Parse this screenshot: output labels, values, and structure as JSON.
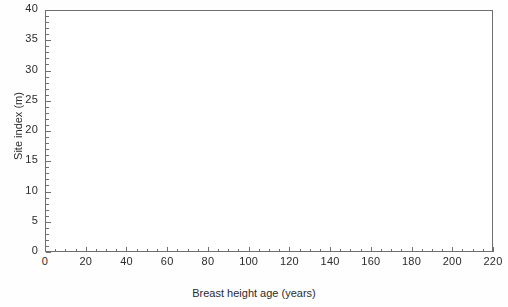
{
  "chart_data": {
    "type": "line",
    "title": "",
    "subtitle": "",
    "xlabel": "Breast height age (years)",
    "ylabel": "Site index (m)",
    "xlim": [
      0,
      220
    ],
    "ylim": [
      0,
      40
    ],
    "xticks": [
      0,
      20,
      40,
      60,
      80,
      100,
      120,
      140,
      160,
      180,
      200,
      220
    ],
    "yticks": [
      0,
      5,
      10,
      15,
      20,
      25,
      30,
      35,
      40
    ],
    "x_minor_step": 5,
    "y_minor_step": 1,
    "grid": false,
    "legend": null,
    "legend_position": "none",
    "marker": "point",
    "line_color": "#3a3a3a",
    "series_summary": {
      "n_series": 160,
      "peak_value": 33.5,
      "peak_age": 2,
      "converged_band": [
        8,
        20
      ],
      "converged_band_age_range": [
        40,
        130
      ],
      "lower_envelope": 4.5,
      "max_age_observed": 206
    },
    "envelope": {
      "age": [
        1,
        2,
        3,
        5,
        8,
        10,
        15,
        20,
        30,
        40,
        60,
        80,
        100,
        120,
        140,
        160,
        180,
        200,
        206
      ],
      "upper": [
        26,
        33.5,
        32,
        28,
        25,
        24,
        23,
        23,
        22.5,
        22.5,
        22.5,
        22,
        22,
        22,
        19,
        17,
        14,
        13,
        13
      ],
      "lower": [
        14,
        13,
        11,
        8.5,
        7,
        6.5,
        5.5,
        5,
        4.6,
        4.8,
        5.5,
        5.8,
        6,
        6.2,
        6.5,
        6.8,
        6.9,
        7,
        7
      ],
      "median": [
        20,
        20.5,
        19,
        17,
        15.5,
        15,
        14.5,
        14,
        13.8,
        13.6,
        13.5,
        13.4,
        13.2,
        13,
        12.5,
        11.5,
        10.5,
        9.8,
        9.6
      ]
    }
  },
  "axes": {
    "x": {
      "title": "Breast height age (years)",
      "labels": [
        "0",
        "20",
        "40",
        "60",
        "80",
        "100",
        "120",
        "140",
        "160",
        "180",
        "200",
        "220"
      ]
    },
    "y": {
      "title": "Site index (m)",
      "labels": [
        "0",
        "5",
        "10",
        "15",
        "20",
        "25",
        "30",
        "35",
        "40"
      ]
    }
  }
}
